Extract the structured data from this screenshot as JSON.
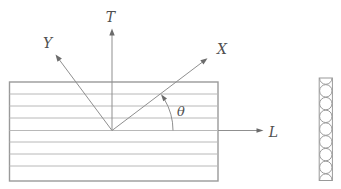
{
  "figure": {
    "axis_labels": {
      "t": "T",
      "y": "Y",
      "x": "X",
      "l": "L"
    },
    "angle_label": "θ",
    "colors": {
      "axis_line": "#8f8f8f",
      "arrowhead": "#6b6b6b",
      "label_text": "#4f4f4f",
      "lamina_border": "#9a9a9a",
      "ply_line": "#b8b8b8",
      "fiber_outline": "#9a9a9a",
      "background": "#ffffff"
    },
    "lamina": {
      "ply_line_count": 7
    },
    "fiber_strip": {
      "fiber_circle_count": 9
    }
  }
}
